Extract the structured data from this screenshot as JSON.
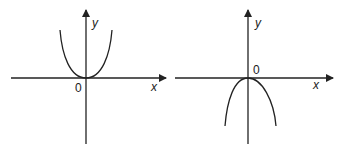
{
  "graphs": [
    {
      "name": "left-graph",
      "description": "upward-opening even-power curve through origin",
      "y_label": "y",
      "x_label": "x",
      "origin_label": "0"
    },
    {
      "name": "right-graph",
      "description": "downward-opening even-power curve through origin",
      "y_label": "y",
      "x_label": "x",
      "origin_label": "0"
    }
  ],
  "colors": {
    "stroke": "#222222",
    "background": "#ffffff"
  }
}
